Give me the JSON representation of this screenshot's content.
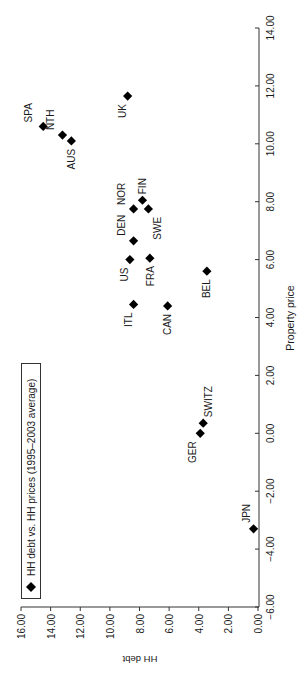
{
  "chart_data": {
    "type": "scatter",
    "title": "",
    "orientation": "rotated-90-ccw",
    "xlabel": "Property price",
    "ylabel": "HH debt",
    "xlim": [
      -6,
      14
    ],
    "ylim": [
      0,
      16
    ],
    "xticks": [
      "-6.00",
      "-4.00",
      "-2.00",
      "0.00",
      "2.00",
      "4.00",
      "6.00",
      "8.00",
      "10.00",
      "12.00",
      "14.00"
    ],
    "yticks": [
      "0.00",
      "2.00",
      "4.00",
      "6.00",
      "8.00",
      "10.00",
      "12.00",
      "14.00",
      "16.00"
    ],
    "grid": false,
    "legend": {
      "position": "upper-left",
      "entries": [
        "HH debt vs. HH prices (1995–2003 average)"
      ]
    },
    "series": [
      {
        "name": "HH debt vs. HH prices (1995–2003 average)",
        "marker": "diamond",
        "color": "#000000",
        "points": [
          {
            "label": "SPA",
            "x": 10.6,
            "y": 14.5
          },
          {
            "label": "NTH",
            "x": 10.3,
            "y": 13.2
          },
          {
            "label": "AUS",
            "x": 10.1,
            "y": 12.6
          },
          {
            "label": "UK",
            "x": 11.65,
            "y": 8.8
          },
          {
            "label": "FIN",
            "x": 8.05,
            "y": 7.8
          },
          {
            "label": "NOR",
            "x": 7.75,
            "y": 8.4
          },
          {
            "label": "SWE",
            "x": 7.75,
            "y": 7.4
          },
          {
            "label": "DEN",
            "x": 6.65,
            "y": 8.4
          },
          {
            "label": "US",
            "x": 6.0,
            "y": 8.65
          },
          {
            "label": "FRA",
            "x": 6.05,
            "y": 7.3
          },
          {
            "label": "BEL",
            "x": 5.6,
            "y": 3.45
          },
          {
            "label": "ITL",
            "x": 4.45,
            "y": 8.4
          },
          {
            "label": "CAN",
            "x": 4.4,
            "y": 6.1
          },
          {
            "label": "SWITZ",
            "x": 0.35,
            "y": 3.7
          },
          {
            "label": "GER",
            "x": 0.0,
            "y": 3.9
          },
          {
            "label": "JPN",
            "x": -3.3,
            "y": 0.3
          }
        ]
      }
    ]
  },
  "labels": {
    "xlabel": "Property price",
    "ylabel": "HH debt",
    "legend_text": "HH debt vs. HH prices (1995–2003 average)"
  }
}
